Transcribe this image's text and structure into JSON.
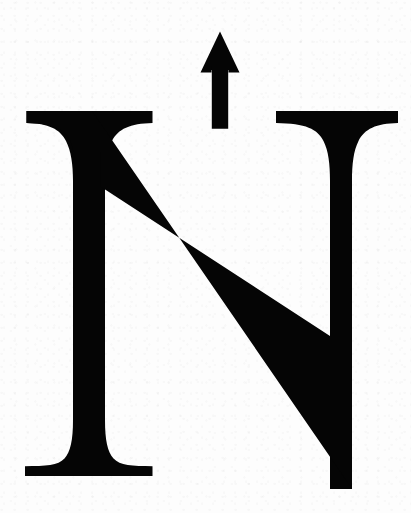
{
  "figure": {
    "name": "north-arrow",
    "type": "map-north-indicator",
    "letter": "N",
    "alt_text": "North arrow symbol consisting of a solid upward arrow above a bold serif capital letter N",
    "orientation_label": "North"
  },
  "colors": {
    "ink": "#050505",
    "background": "#fdfdfd",
    "page": "#ffffff"
  },
  "canvas": {
    "width": 411,
    "height": 513
  },
  "geometry": {
    "arrow": {
      "tip": [
        220,
        32
      ],
      "head_left": [
        202,
        72
      ],
      "head_right": [
        238,
        72
      ],
      "shaft_left": 212,
      "shaft_right": 228,
      "shaft_bottom": 129
    },
    "letter_n": {
      "top_serif_y": 111,
      "baseline_y": 476,
      "left_stem": [
        75,
        105
      ],
      "right_stem": [
        330,
        352
      ],
      "left_serif_span": [
        26,
        152
      ],
      "right_serif_span": [
        276,
        398
      ],
      "diagonal_start": [
        100,
        186
      ],
      "diagonal_end": [
        330,
        336
      ]
    }
  }
}
